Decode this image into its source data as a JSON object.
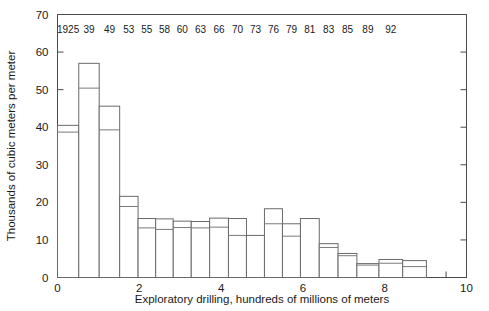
{
  "chart_data": {
    "type": "bar",
    "title": "",
    "subtitle": "",
    "xlabel": "Exploratory drilling, hundreds of millions of meters",
    "ylabel": "Thousands of cubic meters per meter",
    "xlim": [
      0,
      10
    ],
    "ylim": [
      0,
      70
    ],
    "grid": false,
    "legend": null,
    "xticks": [
      0,
      2,
      4,
      6,
      8,
      10
    ],
    "xtick_labels": [
      "0",
      "2",
      "4",
      "6",
      "8",
      "10"
    ],
    "xminor_step": 0.5,
    "yticks": [
      0,
      10,
      20,
      30,
      40,
      50,
      60,
      70
    ],
    "ytick_labels": [
      "0",
      "10",
      "20",
      "30",
      "40",
      "50",
      "60",
      "70"
    ],
    "note": "Variable-width histogram; each bar spans a cumulative drilling interval and is annotated with a year label above the plot. Each bar carries an inner horizontal division line (lower segment value).",
    "annotation_row_labels": [
      "1925",
      "39",
      "49",
      "53",
      "55",
      "58",
      "60",
      "63",
      "66",
      "70",
      "73",
      "76",
      "79",
      "81",
      "83",
      "85",
      "89",
      "92"
    ],
    "bars": [
      {
        "year": "1925",
        "x0": 0.0,
        "x1": 0.52,
        "top": 40.5,
        "split": 38.7
      },
      {
        "year": "39",
        "x0": 0.52,
        "x1": 1.02,
        "top": 57.0,
        "split": 50.4
      },
      {
        "year": "49",
        "x0": 1.02,
        "x1": 1.52,
        "top": 45.6,
        "split": 39.3
      },
      {
        "year": "53",
        "x0": 1.52,
        "x1": 1.97,
        "top": 21.6,
        "split": 18.9
      },
      {
        "year": "55",
        "x0": 1.97,
        "x1": 2.4,
        "top": 15.7,
        "split": 13.2
      },
      {
        "year": "58",
        "x0": 2.4,
        "x1": 2.83,
        "top": 15.6,
        "split": 12.8
      },
      {
        "year": "60",
        "x0": 2.83,
        "x1": 3.27,
        "top": 15.0,
        "split": 13.3
      },
      {
        "year": "63",
        "x0": 3.27,
        "x1": 3.72,
        "top": 14.9,
        "split": 13.2
      },
      {
        "year": "66",
        "x0": 3.72,
        "x1": 4.18,
        "top": 15.8,
        "split": 13.4
      },
      {
        "year": "70",
        "x0": 4.18,
        "x1": 4.62,
        "top": 15.7,
        "split": 11.2
      },
      {
        "year": "73",
        "x0": 4.62,
        "x1": 5.06,
        "top": 11.2,
        "split": 11.2
      },
      {
        "year": "76",
        "x0": 5.06,
        "x1": 5.5,
        "top": 18.3,
        "split": 14.3
      },
      {
        "year": "79",
        "x0": 5.5,
        "x1": 5.94,
        "top": 14.3,
        "split": 11.0
      },
      {
        "year": "81",
        "x0": 5.94,
        "x1": 6.4,
        "top": 15.7,
        "split": 15.7
      },
      {
        "year": "83",
        "x0": 6.4,
        "x1": 6.86,
        "top": 9.0,
        "split": 8.0
      },
      {
        "year": "85",
        "x0": 6.86,
        "x1": 7.32,
        "top": 6.4,
        "split": 5.8
      },
      {
        "year": "89",
        "x0": 7.32,
        "x1": 7.86,
        "top": 3.7,
        "split": 3.3
      },
      {
        "year": "92",
        "x0": 7.86,
        "x1": 8.44,
        "top": 4.8,
        "split": 3.8
      },
      {
        "year": "",
        "x0": 8.44,
        "x1": 9.02,
        "top": 4.5,
        "split": 2.9
      }
    ]
  },
  "axes": {
    "ylabel": "Thousands of cubic meters per meter",
    "xlabel": "Exploratory drilling, hundreds of millions of meters"
  },
  "colors": {
    "background": "#ffffff",
    "axis": "#4a4a4a",
    "bar_stroke": "#6a6a6a",
    "bar_fill": "#ffffff",
    "text": "#1a1a1a"
  }
}
